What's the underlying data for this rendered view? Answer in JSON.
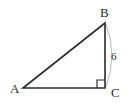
{
  "figure": {
    "background_color": "#ffffff",
    "stroke_color": "#2b2b2b",
    "arc_color": "#b9b9b9",
    "width": 132,
    "height": 108
  },
  "vertices": [
    {
      "id": "A",
      "label": "A",
      "x": 23,
      "y": 88
    },
    {
      "id": "B",
      "label": "B",
      "x": 105,
      "y": 23
    },
    {
      "id": "C",
      "label": "C",
      "x": 105,
      "y": 88
    }
  ],
  "sides": [
    {
      "id": "AB",
      "name": "hypotenuse",
      "from": "A",
      "to": "B",
      "label": ""
    },
    {
      "id": "BC",
      "name": "vertical-leg",
      "from": "B",
      "to": "C",
      "label": "6"
    },
    {
      "id": "AC",
      "name": "horizontal-leg",
      "from": "A",
      "to": "C",
      "label": ""
    }
  ],
  "angles": [
    {
      "id": "C",
      "type": "right-angle",
      "marker": "square",
      "degrees": 90
    }
  ],
  "annotations": {
    "measure_arc": {
      "side": "BC",
      "value": "6",
      "style": "curved-brace"
    }
  },
  "geometry_paths": {
    "triangle": "M 23 88 L 105 23 L 105 88 Z",
    "right_angle_square": "M 97 88 L 97 80 L 105 80",
    "measure_arc": "M 106 24 Q 118 56 106 87"
  }
}
